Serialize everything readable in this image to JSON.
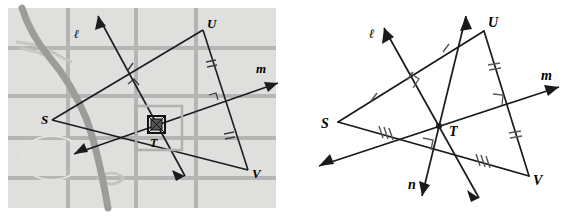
{
  "figure": {
    "type": "geometry-diagram",
    "panel_count": 2
  },
  "left_panel": {
    "name": "map-panel",
    "background_color": "#e8e8e6",
    "block_color": "#dcdcda",
    "street_color": "#b3b3b1",
    "river_color": "#9a9a98",
    "line_color": "#1a1a1a",
    "labels": [
      {
        "text": "ℓ",
        "x": 74,
        "y": 38
      },
      {
        "text": "U",
        "x": 207,
        "y": 28
      },
      {
        "text": "m",
        "x": 256,
        "y": 73
      },
      {
        "text": "S",
        "x": 41,
        "y": 124
      },
      {
        "text": "T",
        "x": 150,
        "y": 145
      },
      {
        "text": "V",
        "x": 255,
        "y": 176
      }
    ],
    "highlight_box": {
      "x": 136,
      "y": 106,
      "width": 46,
      "height": 44
    },
    "marker_point": {
      "x": 156,
      "y": 124,
      "size": 16
    }
  },
  "right_panel": {
    "name": "geometry-panel",
    "background_color": "#ffffff",
    "line_color": "#1a1a1a",
    "tick_color": "#4d4d4d",
    "labels": [
      {
        "text": "ℓ",
        "x": 91,
        "y": 35
      },
      {
        "text": "U",
        "x": 206,
        "y": 28
      },
      {
        "text": "m",
        "x": 262,
        "y": 80
      },
      {
        "text": "S",
        "x": 41,
        "y": 126
      },
      {
        "text": "T",
        "x": 167,
        "y": 133
      },
      {
        "text": "n",
        "x": 129,
        "y": 187
      },
      {
        "text": "V",
        "x": 254,
        "y": 182
      }
    ],
    "tick_marks": {
      "SU": 1,
      "UV": 2,
      "SV": 3
    },
    "right_angles": [
      {
        "name": "angle-at-SU-and-line-l",
        "x": 134,
        "y": 79
      },
      {
        "name": "angle-at-UV-and-line-m",
        "x": 216,
        "y": 99
      },
      {
        "name": "angle-at-SV-and-line-n",
        "x": 146,
        "y": 143
      }
    ],
    "vertices": {
      "S": {
        "x": 55,
        "y": 122
      },
      "U": {
        "x": 201,
        "y": 31
      },
      "V": {
        "x": 246,
        "y": 176
      },
      "T": {
        "x": 156,
        "y": 126
      }
    },
    "lines": [
      {
        "name": "line-l",
        "label": "ℓ",
        "direction": "up-left to down-right"
      },
      {
        "name": "line-m",
        "label": "m",
        "direction": "up-right to down-left"
      },
      {
        "name": "line-n",
        "label": "n",
        "direction": "up-right to down-left"
      }
    ]
  }
}
